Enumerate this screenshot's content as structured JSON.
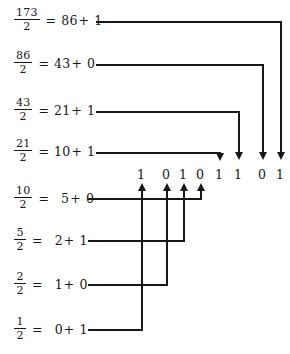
{
  "diagram": {
    "ink_color": "#17171a",
    "background_color": "#ffffff",
    "divisor": "2",
    "equals": "=",
    "plus": "+",
    "steps": [
      {
        "numerator": "173",
        "denominator": "2",
        "quotient": "86",
        "remainder": "1",
        "bit_index": 4
      },
      {
        "numerator": "86",
        "denominator": "2",
        "quotient": "43",
        "remainder": "0",
        "bit_index": 5
      },
      {
        "numerator": "43",
        "denominator": "2",
        "quotient": "21",
        "remainder": "1",
        "bit_index": 6
      },
      {
        "numerator": "21",
        "denominator": "2",
        "quotient": "10",
        "remainder": "1",
        "bit_index": 7
      },
      {
        "numerator": "10",
        "denominator": "2",
        "quotient": "5",
        "remainder": "0",
        "bit_index": 3
      },
      {
        "numerator": "5",
        "denominator": "2",
        "quotient": "2",
        "remainder": "1",
        "bit_index": 2
      },
      {
        "numerator": "2",
        "denominator": "2",
        "quotient": "1",
        "remainder": "0",
        "bit_index": 1
      },
      {
        "numerator": "1",
        "denominator": "2",
        "quotient": "0",
        "remainder": "1",
        "bit_index": 0
      }
    ],
    "result_bits": [
      "1",
      "0",
      "1",
      "0",
      "1",
      "1",
      "0",
      "1"
    ],
    "result_value": "10101101"
  }
}
